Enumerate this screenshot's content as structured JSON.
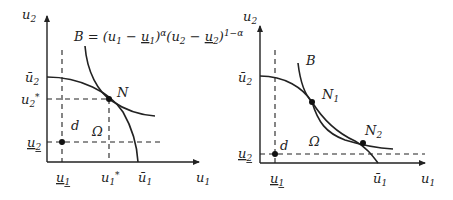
{
  "left_panel": {
    "y_axis_label": "u",
    "y_axis_sub": "2",
    "x_axis_label": "u",
    "x_axis_sub": "1",
    "equation": "B = (u₁ − u̲₁)ᵅ(u₂ − u̲₂)¹⁻ᵅ",
    "eq_parts": {
      "prefix": "B = (u",
      "s1": "1",
      "mid1": " − ",
      "u1": "u",
      "s2": "1",
      "mid2": ")",
      "alpha": "α",
      "mid3": "(u",
      "s3": "2",
      "mid4": " − ",
      "u2": "u",
      "s4": "2",
      "mid5": ")",
      "exp": "1−α"
    },
    "u2_bar": {
      "base": "ū",
      "sub": "2"
    },
    "u2_star": {
      "base": "u",
      "sub": "2",
      "sup": "*"
    },
    "u2_under": {
      "base": "u",
      "sub": "2"
    },
    "u1_under": {
      "base": "u",
      "sub": "1"
    },
    "u1_star": {
      "base": "u",
      "sub": "1",
      "sup": "*"
    },
    "u1_bar": {
      "base": "ū",
      "sub": "1"
    },
    "point_N": "N",
    "point_d": "d",
    "region": "Ω"
  },
  "right_panel": {
    "y_axis_label": "u",
    "y_axis_sub": "2",
    "x_axis_label": "u",
    "x_axis_sub": "1",
    "curve_B": "B",
    "u2_bar": {
      "base": "ū",
      "sub": "2"
    },
    "u2_under": {
      "base": "u",
      "sub": "2"
    },
    "u1_under": {
      "base": "u",
      "sub": "1"
    },
    "u1_bar": {
      "base": "ū",
      "sub": "1"
    },
    "point_N1": {
      "base": "N",
      "sub": "1"
    },
    "point_N2": {
      "base": "N",
      "sub": "2"
    },
    "point_d": "d",
    "region": "Ω"
  }
}
